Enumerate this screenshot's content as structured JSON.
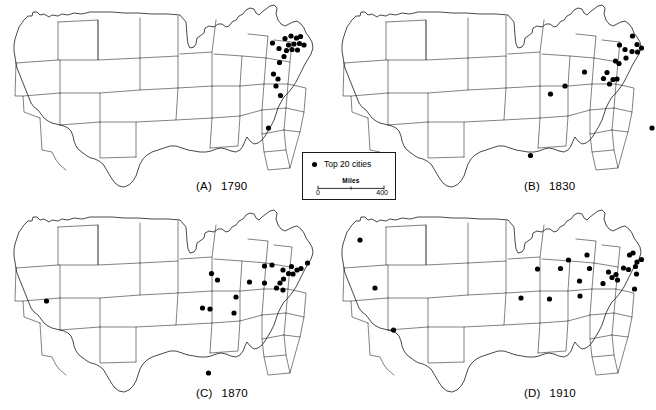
{
  "figure": {
    "title": "",
    "type": "map-series",
    "panel_count": 4
  },
  "legend": {
    "name": "map-legend",
    "symbol": "filled-circle",
    "symbol_label": "Top 20 cities",
    "scale": {
      "title": "Miles",
      "min_label": "0",
      "max_label": "400",
      "tick_labels": [
        "0",
        "400"
      ],
      "units": "Miles"
    }
  },
  "style": {
    "dot_color": "#000000",
    "outline_color": "#1a1a1a",
    "background": "#ffffff",
    "dot_radius": 2.6
  },
  "panels": [
    {
      "id": "A",
      "letter": "(A)",
      "year": "1790",
      "name": "panel-1790",
      "dot_count": 20,
      "dots": [
        [
          285.0,
          38.5
        ],
        [
          291.0,
          36.0
        ],
        [
          296.5,
          38.0
        ],
        [
          300.5,
          36.5
        ],
        [
          288.5,
          45.0
        ],
        [
          294.0,
          44.0
        ],
        [
          299.5,
          43.5
        ],
        [
          304.0,
          45.0
        ],
        [
          272.5,
          43.0
        ],
        [
          279.0,
          48.5
        ],
        [
          286.5,
          50.5
        ],
        [
          292.0,
          49.5
        ],
        [
          297.5,
          50.0
        ],
        [
          284.0,
          56.5
        ],
        [
          279.5,
          62.5
        ],
        [
          273.5,
          74.0
        ],
        [
          278.0,
          79.0
        ],
        [
          276.0,
          86.0
        ],
        [
          280.5,
          95.5
        ],
        [
          268.5,
          128.0
        ]
      ]
    },
    {
      "id": "B",
      "letter": "(B)",
      "year": "1830",
      "name": "panel-1830",
      "dot_count": 20,
      "dots": [
        [
          632.5,
          36.0
        ],
        [
          619.5,
          45.0
        ],
        [
          637.0,
          44.5
        ],
        [
          641.5,
          48.0
        ],
        [
          625.0,
          49.5
        ],
        [
          632.0,
          51.5
        ],
        [
          637.5,
          52.0
        ],
        [
          626.0,
          58.0
        ],
        [
          615.5,
          61.0
        ],
        [
          619.0,
          63.5
        ],
        [
          607.0,
          72.5
        ],
        [
          603.5,
          78.5
        ],
        [
          613.0,
          79.5
        ],
        [
          609.5,
          84.0
        ],
        [
          617.0,
          79.0
        ],
        [
          584.5,
          72.0
        ],
        [
          565.0,
          86.0
        ],
        [
          550.5,
          94.0
        ],
        [
          652.0,
          128.0
        ],
        [
          530.5,
          155.5
        ]
      ]
    },
    {
      "id": "C",
      "letter": "(C)",
      "year": "1870",
      "name": "panel-1870",
      "dots": [
        [
          307.5,
          263.0
        ],
        [
          291.5,
          266.5
        ],
        [
          297.0,
          270.0
        ],
        [
          301.0,
          268.5
        ],
        [
          283.0,
          270.0
        ],
        [
          288.5,
          273.5
        ],
        [
          293.0,
          274.0
        ],
        [
          283.5,
          279.0
        ],
        [
          272.0,
          265.0
        ],
        [
          264.5,
          283.0
        ],
        [
          280.0,
          283.0
        ],
        [
          276.5,
          288.0
        ],
        [
          283.0,
          290.0
        ],
        [
          249.5,
          282.0
        ],
        [
          264.5,
          266.0
        ],
        [
          236.0,
          297.0
        ],
        [
          211.5,
          273.5
        ],
        [
          217.5,
          280.0
        ],
        [
          234.0,
          313.0
        ],
        [
          202.5,
          308.0
        ],
        [
          210.0,
          309.0
        ],
        [
          46.5,
          301.0
        ],
        [
          208.5,
          373.0
        ]
      ]
    },
    {
      "id": "D",
      "letter": "(D)",
      "year": "1910",
      "name": "panel-1910",
      "dots": [
        [
          629.5,
          255.0
        ],
        [
          637.0,
          262.0
        ],
        [
          641.5,
          259.5
        ],
        [
          635.5,
          266.5
        ],
        [
          628.5,
          269.5
        ],
        [
          623.5,
          268.0
        ],
        [
          616.0,
          274.5
        ],
        [
          608.5,
          272.0
        ],
        [
          612.0,
          277.5
        ],
        [
          617.5,
          280.0
        ],
        [
          636.5,
          274.0
        ],
        [
          603.0,
          283.5
        ],
        [
          633.0,
          253.0
        ],
        [
          589.5,
          268.5
        ],
        [
          587.0,
          255.0
        ],
        [
          579.5,
          281.0
        ],
        [
          568.5,
          260.0
        ],
        [
          560.5,
          268.5
        ],
        [
          580.0,
          296.0
        ],
        [
          549.5,
          299.0
        ],
        [
          521.0,
          298.0
        ],
        [
          537.5,
          269.0
        ],
        [
          375.0,
          288.0
        ],
        [
          393.5,
          330.0
        ],
        [
          360.0,
          240.0
        ],
        [
          634.5,
          494.0
        ]
      ]
    }
  ]
}
